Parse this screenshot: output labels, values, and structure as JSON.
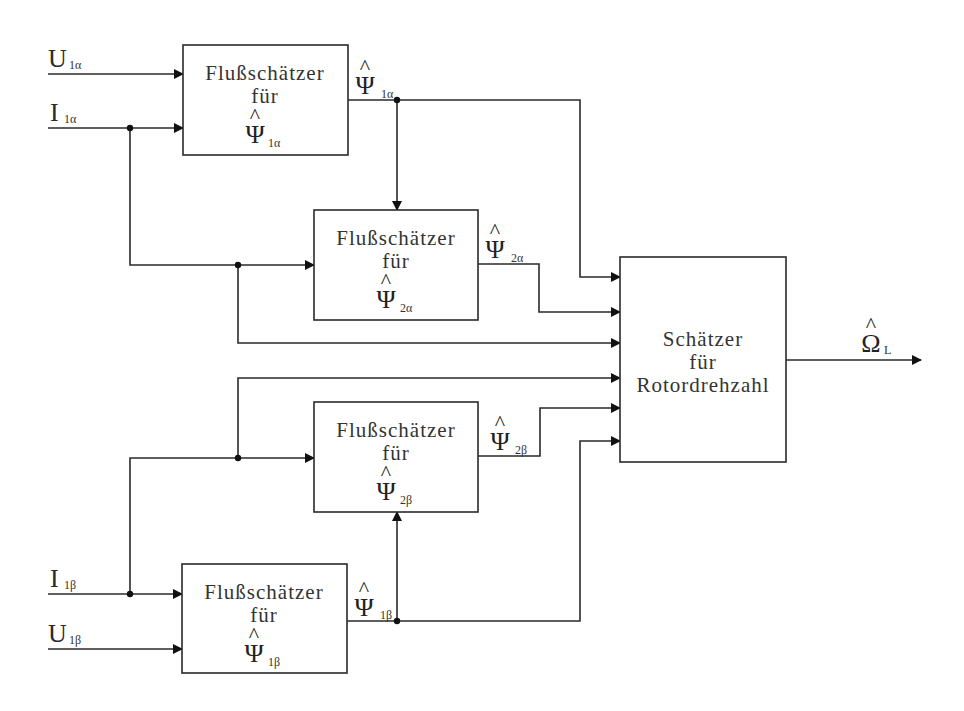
{
  "diagram": {
    "type": "block-diagram",
    "colors": {
      "line": "#2a2a2a",
      "background": "#ffffff"
    },
    "inputs": {
      "u1a": {
        "main": "U",
        "sub": "1α"
      },
      "i1a": {
        "main": "I",
        "sub": "1α"
      },
      "i1b": {
        "main": "I",
        "sub": "1β"
      },
      "u1b": {
        "main": "U",
        "sub": "1β"
      }
    },
    "blocks": {
      "flux1a": {
        "line1": "Flußschätzer",
        "line2": "für",
        "sym": "Ψ",
        "hat": "^",
        "sub": "1α"
      },
      "flux2a": {
        "line1": "Flußschätzer",
        "line2": "für",
        "sym": "Ψ",
        "hat": "^",
        "sub": "2α"
      },
      "flux2b": {
        "line1": "Flußschätzer",
        "line2": "für",
        "sym": "Ψ",
        "hat": "^",
        "sub": "2β"
      },
      "flux1b": {
        "line1": "Flußschätzer",
        "line2": "für",
        "sym": "Ψ",
        "hat": "^",
        "sub": "1β"
      },
      "speed": {
        "line1": "Schätzer",
        "line2": "für",
        "line3": "Rotordrehzahl"
      }
    },
    "signals": {
      "psi1a": {
        "sym": "Ψ",
        "hat": "^",
        "sub": "1α"
      },
      "psi2a": {
        "sym": "Ψ",
        "hat": "^",
        "sub": "2α"
      },
      "psi2b": {
        "sym": "Ψ",
        "hat": "^",
        "sub": "2β"
      },
      "psi1b": {
        "sym": "Ψ",
        "hat": "^",
        "sub": "1β"
      },
      "omega": {
        "sym": "Ω",
        "hat": "^",
        "sub": "L"
      }
    }
  }
}
